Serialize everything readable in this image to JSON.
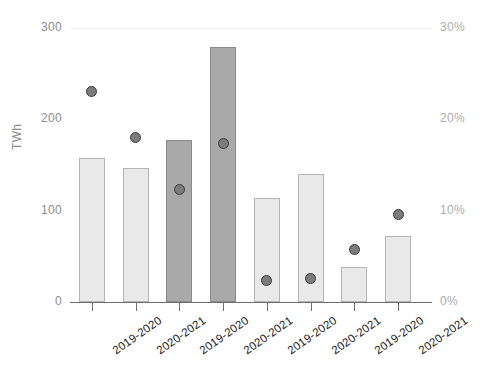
{
  "chart_data": {
    "type": "bar",
    "title": "",
    "xlabel": "",
    "ylabel": "TWh",
    "y2label": "",
    "grid": false,
    "legend": "none",
    "categories": [
      "2019-2020",
      "2020-2021",
      "2019-2020",
      "2020-2021",
      "2019-2020",
      "2020-2021",
      "2019-2020",
      "2020-2021"
    ],
    "ylim": [
      0,
      300
    ],
    "y2lim": [
      0,
      30
    ],
    "yticks": [
      "0",
      "100",
      "200",
      "300"
    ],
    "ytick_values": [
      0,
      100,
      200,
      300
    ],
    "y2ticks": [
      "0%",
      "10%",
      "20%",
      "30%"
    ],
    "y2tick_values": [
      0,
      10,
      20,
      30
    ],
    "series": [
      {
        "name": "Energy",
        "type": "bar",
        "unit": "TWh",
        "axis": "left",
        "values": [
          158,
          147,
          177,
          279,
          114,
          140,
          38,
          72
        ],
        "shades": [
          "light",
          "light",
          "dark",
          "dark",
          "light",
          "light",
          "light",
          "light"
        ]
      },
      {
        "name": "Share",
        "type": "scatter",
        "unit": "%",
        "axis": "right",
        "values": [
          23.0,
          18.0,
          12.3,
          17.4,
          2.3,
          2.6,
          5.8,
          9.6
        ]
      }
    ],
    "colors": {
      "bar_light_fill": "#e9e9e9",
      "bar_light_stroke": "#b5b5b5",
      "bar_dark_fill": "#a9a9a9",
      "bar_dark_stroke": "#8a8a8a",
      "dot_fill": "#7c7c7c",
      "dot_stroke": "#3a3a3a",
      "axis": "#6e6e6e",
      "left_tick_text": "#8c8c8c",
      "right_tick_text": "#adadad",
      "xtick_text": "#1f1f1f",
      "gridline": "#f1f1f1",
      "background": "#ffffff"
    }
  }
}
